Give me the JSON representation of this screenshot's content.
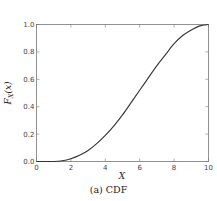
{
  "chart_data": {
    "type": "line",
    "title": "",
    "caption": "(a) CDF",
    "xlabel": "X",
    "ylabel": "F_X(x)",
    "xlim": [
      0,
      10
    ],
    "ylim": [
      0.0,
      1.0
    ],
    "xticks": [
      "0",
      "2",
      "4",
      "6",
      "8",
      "10"
    ],
    "yticks": [
      "0.0",
      "0.2",
      "0.4",
      "0.6",
      "0.8",
      "1.0"
    ],
    "grid": false,
    "legend": null,
    "series": [
      {
        "name": "CDF",
        "color": "#333333",
        "x": [
          0,
          0.5,
          1.0,
          1.5,
          2.0,
          2.5,
          3.0,
          3.5,
          4.0,
          4.5,
          5.0,
          5.5,
          6.0,
          6.5,
          7.0,
          7.5,
          8.0,
          8.5,
          9.0,
          9.5,
          10.0
        ],
        "y": [
          0.0,
          0.0,
          0.0,
          0.005,
          0.02,
          0.045,
          0.08,
          0.13,
          0.19,
          0.26,
          0.34,
          0.43,
          0.52,
          0.61,
          0.7,
          0.78,
          0.86,
          0.92,
          0.96,
          0.99,
          1.0
        ]
      }
    ]
  },
  "caption": "(a) CDF"
}
